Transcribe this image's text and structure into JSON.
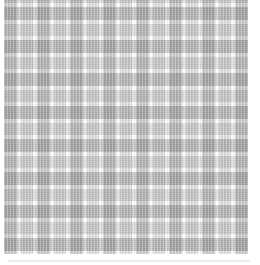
{
  "image": {
    "kind": "fabric-swatch-photo",
    "description": "Gray and white plaid (tartan) fabric swatch on a white background",
    "pattern": "plaid",
    "visible_text": ""
  },
  "colors": {
    "background": "#ffffff",
    "stripe_white": "#ffffff",
    "stripe_medium": "#c6c6c6",
    "stripe_light": "#dcdcdc",
    "intersection_dark": "#9e9e9e",
    "intersection_mid": "#b2b2b2",
    "edge_shadow": "#ebebeb"
  }
}
